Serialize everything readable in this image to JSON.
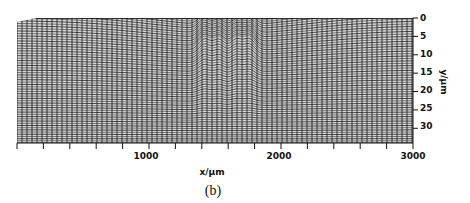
{
  "chart_data": {
    "type": "surface-mesh",
    "title": "",
    "caption": "(b)",
    "xlabel": "x/μm",
    "ylabel": "y/μm",
    "x_ticks": [
      1000,
      2000,
      3000
    ],
    "x_tick_labels": [
      "1000",
      "2000",
      "3000"
    ],
    "x_minor_tick_step": 200,
    "xlim": [
      0,
      3000
    ],
    "y_ticks": [
      0,
      5,
      10,
      15,
      20,
      25,
      30
    ],
    "y_tick_labels": [
      "0",
      "5",
      "10",
      "15",
      "20",
      "25",
      "30"
    ],
    "ylim": [
      0,
      34
    ],
    "grid": false,
    "legend": null,
    "features": [
      {
        "type": "peak",
        "x": 1420,
        "depth_um": 11
      },
      {
        "type": "peak",
        "x": 1530,
        "depth_um": 9
      },
      {
        "type": "peak",
        "x": 1660,
        "depth_um": 9
      },
      {
        "type": "peak",
        "x": 1760,
        "depth_um": 11
      }
    ]
  },
  "figure": {
    "caption": "(b)",
    "x_axis_title": "x/μm",
    "y_axis_title": "y/μm"
  }
}
